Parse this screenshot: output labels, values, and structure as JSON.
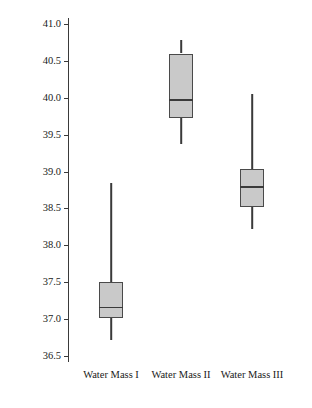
{
  "chart_data": {
    "type": "box",
    "title": "",
    "xlabel": "",
    "ylabel": "Salinity (parts per thousand)",
    "ylim": [
      36.5,
      41.0
    ],
    "ytick_step": 0.5,
    "yticks": [
      "41.0",
      "40.5",
      "40.0",
      "39.5",
      "39.0",
      "38.5",
      "38.0",
      "37.5",
      "37.0",
      "36.5"
    ],
    "grid": false,
    "legend": "none",
    "categories": [
      "Water Mass I",
      "Water Mass II",
      "Water Mass III"
    ],
    "boxes": [
      {
        "label": "Water Mass I",
        "whisker_low": 36.72,
        "q1": 37.02,
        "median": 37.17,
        "q3": 37.5,
        "whisker_high": 38.85
      },
      {
        "label": "Water Mass II",
        "whisker_low": 39.38,
        "q1": 39.72,
        "median": 39.98,
        "q3": 40.6,
        "whisker_high": 40.78
      },
      {
        "label": "Water Mass III",
        "whisker_low": 38.22,
        "q1": 38.52,
        "median": 38.8,
        "q3": 39.04,
        "whisker_high": 40.05
      }
    ],
    "colors": {
      "box_fill": "#c9c9c9",
      "box_stroke": "#4a4a4a",
      "line": "#3a3a3a",
      "text": "#1a1a1a",
      "background": "#ffffff"
    }
  }
}
